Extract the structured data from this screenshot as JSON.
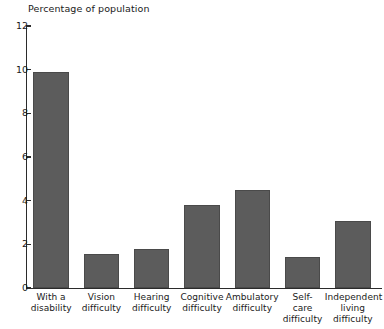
{
  "chart_data": {
    "type": "bar",
    "title": "Percentage of population",
    "xlabel": "",
    "ylabel": "Percentage of population",
    "ylim": [
      0,
      12
    ],
    "yticks": [
      0,
      2,
      4,
      6,
      8,
      10,
      12
    ],
    "ytick_labels": [
      "0",
      "2",
      "4",
      "6",
      "8",
      "10",
      "12"
    ],
    "grid": false,
    "legend": null,
    "bar_color": "#5c5c5c",
    "bar_edge_color": "#4a4a4a",
    "axis_color": "#2b2b2b",
    "categories": [
      "With a disability",
      "Vision difficulty",
      "Hearing difficulty",
      "Cognitive difficulty",
      "Ambulatory difficulty",
      "Self-care difficulty",
      "Independent living difficulty"
    ],
    "category_lines": [
      [
        "With a",
        "disability"
      ],
      [
        "Vision",
        "difficulty"
      ],
      [
        "Hearing",
        "difficulty"
      ],
      [
        "Cognitive",
        "difficulty"
      ],
      [
        "Ambulatory",
        "difficulty"
      ],
      [
        "Self-",
        "care",
        "difficulty"
      ],
      [
        "Independent",
        "living",
        "difficulty"
      ]
    ],
    "values": [
      9.9,
      1.55,
      1.8,
      3.8,
      4.5,
      1.4,
      3.05
    ]
  }
}
